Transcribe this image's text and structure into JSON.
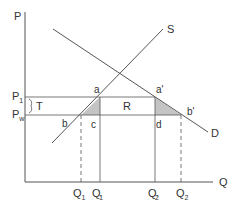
{
  "diagram": {
    "type": "supply-demand-tariff",
    "axes": {
      "y_label": "P",
      "x_label": "Q"
    },
    "curves": {
      "supply_label": "S",
      "demand_label": "D"
    },
    "price_levels": {
      "p1": {
        "main": "P",
        "sub": "1"
      },
      "pw": {
        "main": "P",
        "sub": "w"
      },
      "tariff_label": "T"
    },
    "points": {
      "a": "a",
      "a_prime": "a'",
      "b": "b",
      "b_prime": "b'",
      "c": "c",
      "d": "d"
    },
    "areas": {
      "revenue_label": "R"
    },
    "quantities": [
      {
        "main": "Q",
        "sub": "1",
        "prime": false
      },
      {
        "main": "Q",
        "sub": "1",
        "prime": true
      },
      {
        "main": "Q",
        "sub": "2",
        "prime": true
      },
      {
        "main": "Q",
        "sub": "2",
        "prime": false
      }
    ],
    "colors": {
      "line": "#555555",
      "shade": "#c4c4c4",
      "text": "#333333"
    }
  }
}
